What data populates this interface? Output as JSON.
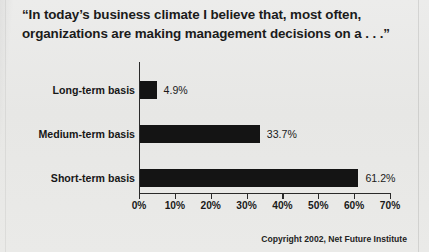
{
  "title": {
    "line1": "“In today’s business climate I believe that, most often,",
    "line2": "organizations are making management decisions on a . . .”"
  },
  "footer": {
    "copyright": "Copyright 2002, Net Future Institute"
  },
  "colors": {
    "bar": "#141414",
    "axis": "#2a2a2a",
    "text": "#1b1b1b",
    "background": "#e9e9e7"
  },
  "chart_data": {
    "type": "bar",
    "orientation": "horizontal",
    "title": "“In today’s business climate I believe that, most often, organizations are making management decisions on a . . .”",
    "xlabel": "",
    "ylabel": "",
    "categories": [
      "Long-term basis",
      "Medium-term basis",
      "Short-term basis"
    ],
    "values": [
      4.9,
      33.7,
      61.2
    ],
    "value_labels": [
      "4.9%",
      "33.7%",
      "61.2%"
    ],
    "xlim": [
      0,
      70
    ],
    "xticks": [
      0,
      10,
      20,
      30,
      40,
      50,
      60,
      70
    ],
    "xtick_labels": [
      "0%",
      "10%",
      "20%",
      "30%",
      "40%",
      "50%",
      "60%",
      "70%"
    ],
    "grid": false,
    "legend": false
  }
}
